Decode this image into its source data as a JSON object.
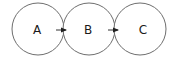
{
  "diagram": {
    "type": "flow",
    "colors": {
      "node_stroke": "#6e6e6e",
      "node_fill": "#ffffff",
      "edge": "#222222",
      "label": "#1a1a1a"
    },
    "nodes": [
      {
        "id": "A",
        "label": "A",
        "cx": 38,
        "cy": 29,
        "r": 26
      },
      {
        "id": "B",
        "label": "B",
        "cx": 89,
        "cy": 29,
        "r": 26
      },
      {
        "id": "C",
        "label": "C",
        "cx": 140,
        "cy": 29,
        "r": 26
      }
    ],
    "edges": [
      {
        "from": "A",
        "to": "B"
      },
      {
        "from": "B",
        "to": "C"
      }
    ]
  }
}
